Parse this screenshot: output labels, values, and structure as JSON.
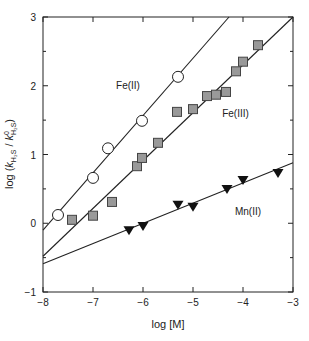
{
  "chart_data": {
    "type": "scatter",
    "title": "",
    "xlabel": "log [M]",
    "ylabel": "log (k_H2S / k0_H2S)",
    "ylabel_parts": {
      "prefix": "log (",
      "k1": "k",
      "sub1": "H₂S",
      "slash": " / ",
      "k2": "k",
      "sup2": "0",
      "sub2": "H₂S",
      "suffix": ")"
    },
    "xlim": [
      -8,
      -3
    ],
    "ylim": [
      -1,
      3
    ],
    "x_ticks": [
      -8,
      -7,
      -6,
      -5,
      -4,
      -3
    ],
    "x_tick_labels": [
      "−8",
      "−7",
      "−6",
      "−5",
      "−4",
      "−3"
    ],
    "y_ticks": [
      -1,
      0,
      1,
      2,
      3
    ],
    "y_tick_labels": [
      "−1",
      "0",
      "1",
      "2",
      "3"
    ],
    "y_minor_ticks": [
      -0.5,
      0.5,
      1.5,
      2.5
    ],
    "grid": false,
    "legend": "inline labels",
    "series": [
      {
        "name": "Fe(II)",
        "marker": "open-circle",
        "label_pos": [
          -6.3,
          1.95
        ],
        "points": [
          [
            -7.7,
            0.12
          ],
          [
            -7.0,
            0.66
          ],
          [
            -6.7,
            1.09
          ],
          [
            -6.02,
            1.49
          ],
          [
            -5.3,
            2.13
          ]
        ],
        "fit_line": [
          [
            -8.0,
            -0.1
          ],
          [
            -4.28,
            3.0
          ]
        ]
      },
      {
        "name": "Fe(III)",
        "marker": "gray-square",
        "label_pos": [
          -4.15,
          1.55
        ],
        "points": [
          [
            -7.42,
            0.05
          ],
          [
            -7.0,
            0.11
          ],
          [
            -6.62,
            0.31
          ],
          [
            -6.12,
            0.83
          ],
          [
            -6.02,
            0.95
          ],
          [
            -5.7,
            1.17
          ],
          [
            -5.32,
            1.62
          ],
          [
            -5.0,
            1.66
          ],
          [
            -4.72,
            1.85
          ],
          [
            -4.54,
            1.87
          ],
          [
            -4.34,
            1.91
          ],
          [
            -4.14,
            2.21
          ],
          [
            -4.0,
            2.35
          ],
          [
            -3.7,
            2.59
          ]
        ],
        "fit_line": [
          [
            -8.0,
            -0.48
          ],
          [
            -3.0,
            3.0
          ]
        ]
      },
      {
        "name": "Mn(II)",
        "marker": "filled-down-triangle",
        "label_pos": [
          -3.9,
          0.12
        ],
        "points": [
          [
            -6.28,
            -0.1
          ],
          [
            -6.0,
            -0.04
          ],
          [
            -5.3,
            0.27
          ],
          [
            -5.0,
            0.24
          ],
          [
            -4.32,
            0.5
          ],
          [
            -4.0,
            0.63
          ],
          [
            -3.3,
            0.73
          ]
        ],
        "fit_line": [
          [
            -8.0,
            -0.59
          ],
          [
            -3.0,
            0.88
          ]
        ]
      }
    ],
    "colors": {
      "axis": "#222222",
      "line": "#222222",
      "square_fill": "#999999",
      "triangle_fill": "#111111",
      "circle_fill": "#ffffff"
    }
  }
}
